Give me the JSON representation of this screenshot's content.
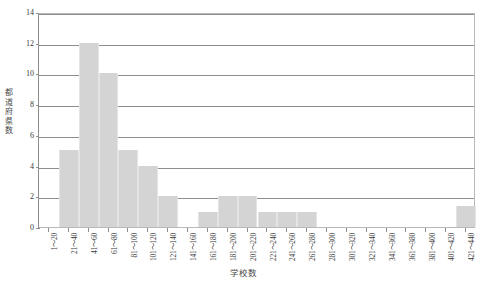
{
  "chart_data": {
    "type": "bar",
    "title": "",
    "xlabel": "学校数",
    "ylabel": "都道府県数",
    "ylim": [
      0,
      14
    ],
    "y_ticks": [
      0,
      2,
      4,
      6,
      8,
      10,
      12,
      14
    ],
    "grid": true,
    "legend": null,
    "bar_color": "#d4d4d4",
    "categories": [
      "1～20",
      "21～40",
      "41～60",
      "61～80",
      "81～100",
      "101～120",
      "121～140",
      "141～160",
      "161～180",
      "181～200",
      "201～220",
      "221～240",
      "241～260",
      "261～280",
      "281～300",
      "301～320",
      "321～340",
      "341～360",
      "361～380",
      "381～400",
      "401～420",
      "421～440"
    ],
    "values": [
      0,
      5,
      12,
      10,
      5,
      4,
      2,
      0,
      1,
      2,
      2,
      1,
      1,
      1,
      0,
      0,
      0,
      0,
      0,
      0,
      0,
      1.4
    ]
  },
  "colors": {
    "bar": "#d4d4d4",
    "bar_edge": "#e4e4e4",
    "axis": "#8d8d8d",
    "frame": "#b9b9b9",
    "text": "#3a3a3a"
  }
}
